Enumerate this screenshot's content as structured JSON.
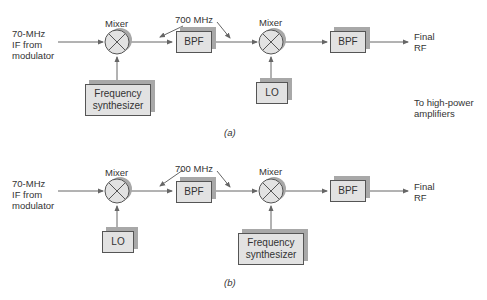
{
  "diagram_a": {
    "caption": "(a)",
    "input_label": "70-MHz\nIF from\nmodulator",
    "mixer1_label": "Mixer",
    "mixer2_label": "Mixer",
    "freq_label": "700 MHz",
    "bpf1": "BPF",
    "bpf2": "BPF",
    "synth": "Frequency\nsynthesizer",
    "lo": "LO",
    "output_label": "Final\nRF",
    "note": "To high-power\namplifiers"
  },
  "diagram_b": {
    "caption": "(b)",
    "input_label": "70-MHz\nIF from\nmodulator",
    "mixer1_label": "Mixer",
    "mixer2_label": "Mixer",
    "freq_label": "700 MHz",
    "bpf1": "BPF",
    "bpf2": "BPF",
    "lo": "LO",
    "synth": "Frequency\nsynthesizer",
    "output_label": "Final\nRF"
  }
}
